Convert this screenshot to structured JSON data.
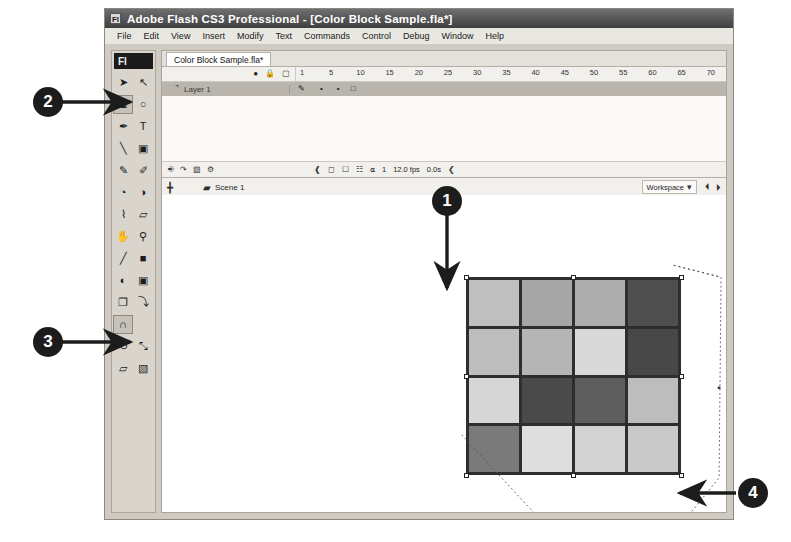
{
  "window": {
    "title": "Adobe Flash CS3 Professional - [Color Block Sample.fla*]",
    "app_badge": "Fl",
    "menu": [
      "File",
      "Edit",
      "View",
      "Insert",
      "Modify",
      "Text",
      "Commands",
      "Control",
      "Debug",
      "Window",
      "Help"
    ]
  },
  "document": {
    "tab_label": "Color Block Sample.fla*"
  },
  "tools": {
    "logo": "Fl",
    "items": [
      {
        "name": "selection-tool",
        "glyph": "➤",
        "selected": false
      },
      {
        "name": "subselection-tool",
        "glyph": "↖",
        "selected": false
      },
      {
        "name": "free-transform-tool",
        "glyph": "⧉",
        "selected": true
      },
      {
        "name": "lasso-tool",
        "glyph": "○",
        "selected": false
      },
      {
        "name": "pen-tool",
        "glyph": "✒",
        "selected": false
      },
      {
        "name": "text-tool",
        "glyph": "T",
        "selected": false
      },
      {
        "name": "line-tool",
        "glyph": "╲",
        "selected": false
      },
      {
        "name": "rectangle-tool",
        "glyph": "▣",
        "selected": false
      },
      {
        "name": "pencil-tool",
        "glyph": "✎",
        "selected": false
      },
      {
        "name": "brush-tool",
        "glyph": "✐",
        "selected": false
      },
      {
        "name": "ink-bottle-tool",
        "glyph": "◔",
        "selected": false
      },
      {
        "name": "paint-bucket-tool",
        "glyph": "◑",
        "selected": false
      },
      {
        "name": "eyedropper-tool",
        "glyph": "⌇",
        "selected": false
      },
      {
        "name": "eraser-tool",
        "glyph": "▱",
        "selected": false
      },
      {
        "name": "hand-tool",
        "glyph": "✋",
        "selected": false
      },
      {
        "name": "zoom-tool",
        "glyph": "⚲",
        "selected": false
      },
      {
        "name": "stroke-color-swatch",
        "glyph": "╱",
        "selected": false
      },
      {
        "name": "fill-color-swatch",
        "glyph": "■",
        "selected": false
      },
      {
        "name": "black-white-swatch",
        "glyph": "◐",
        "selected": false
      },
      {
        "name": "swap-colors-swatch",
        "glyph": "▣",
        "selected": false
      },
      {
        "name": "object-drawing-option",
        "glyph": "❐",
        "selected": false
      },
      {
        "name": "smooth-option",
        "glyph": "⤵",
        "selected": false
      },
      {
        "name": "snap-to-objects-option",
        "glyph": "∩",
        "selected": true
      },
      {
        "name": "rotate-option",
        "glyph": "↻",
        "selected": false
      },
      {
        "name": "scale-option",
        "glyph": "⤡",
        "selected": false
      },
      {
        "name": "distort-option",
        "glyph": "▱",
        "selected": false
      },
      {
        "name": "envelope-option",
        "glyph": "▧",
        "selected": false
      }
    ]
  },
  "timeline": {
    "header_icons": [
      "eye-icon",
      "lock-icon",
      "outline-square-icon"
    ],
    "ruler_ticks": [
      "1",
      "5",
      "10",
      "15",
      "20",
      "25",
      "30",
      "35",
      "40",
      "45",
      "50",
      "55",
      "60",
      "65",
      "70",
      "75"
    ],
    "layers": [
      {
        "name": "Layer 1",
        "pencil": "✎",
        "dot1": "•",
        "dot2": "•",
        "square": "□"
      }
    ],
    "status": {
      "current_frame": "1",
      "frame_rate": "12.0 fps",
      "elapsed": "0.0s",
      "left_icons": [
        "new-layer-icon",
        "new-folder-icon",
        "delete-layer-icon",
        "properties-icon"
      ],
      "right_icons": [
        "center-frame-icon",
        "onion-skin-icon",
        "onion-outline-icon",
        "edit-multiple-icon",
        "modify-markers-icon"
      ]
    }
  },
  "scene_bar": {
    "edit_scene_icon": "╋",
    "scene_icon": "▰",
    "scene_name": "Scene 1",
    "workspace_label": "Workspace",
    "workspace_caret": "▾",
    "right_icons": [
      "edit-scene-icon",
      "edit-symbols-icon"
    ]
  },
  "stage": {
    "artwork_name": "color-block-grid",
    "rows": 4,
    "cols": 4,
    "blocks": [
      [
        "#bfbfbf",
        "#a6a6a6",
        "#adadad",
        "#4f4f4f"
      ],
      [
        "#bdbdbd",
        "#b5b5b5",
        "#d9d9d9",
        "#484848"
      ],
      [
        "#d6d6d6",
        "#4a4a4a",
        "#5e5e5e",
        "#bdbdbd"
      ],
      [
        "#7a7a7a",
        "#dedede",
        "#d2d2d2",
        "#c9c9c9"
      ]
    ],
    "grid_line_color": "#2e2e2e"
  },
  "callouts": [
    {
      "id": "1",
      "label": "1",
      "target": "color-block-artwork"
    },
    {
      "id": "2",
      "label": "2",
      "target": "free-transform-tool"
    },
    {
      "id": "3",
      "label": "3",
      "target": "distort-option"
    },
    {
      "id": "4",
      "label": "4",
      "target": "transform-corner-handle"
    }
  ]
}
